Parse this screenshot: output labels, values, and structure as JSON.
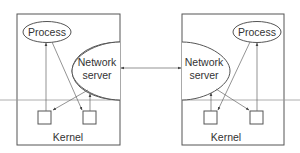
{
  "diagram": {
    "machines": [
      {
        "id": "left",
        "process_label": "Process",
        "server_label_line1": "Network",
        "server_label_line2": "server",
        "kernel_label": "Kernel"
      },
      {
        "id": "right",
        "process_label": "Process",
        "server_label_line1": "Network",
        "server_label_line2": "server",
        "kernel_label": "Kernel"
      }
    ],
    "connection": {
      "from": "left.network-server",
      "to": "right.network-server",
      "bidirectional": true
    },
    "colors": {
      "stroke": "#555555",
      "text": "#333333",
      "divider": "#999999"
    }
  }
}
